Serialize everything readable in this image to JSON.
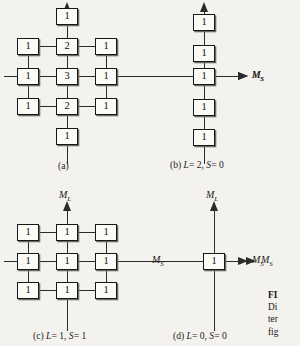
{
  "figure": {
    "panels": [
      {
        "id": "a",
        "caption": "(a)",
        "layout": "cross",
        "axis_labels": {
          "horizontal_right": "M",
          "horizontal_right_sub": "S"
        },
        "grid_values": [
          [
            "",
            "1",
            ""
          ],
          [
            "1",
            "2",
            "1"
          ],
          [
            "1",
            "3",
            "1"
          ],
          [
            "1",
            "2",
            "1"
          ],
          [
            "",
            "1",
            ""
          ]
        ]
      },
      {
        "id": "b",
        "caption": "(b) L = 2, S = 0",
        "caption_parts": {
          "tag": "(b)",
          "L_label": "L",
          "L_value": "= 2,",
          "S_label": "S",
          "S_value": "= 0"
        },
        "layout": "column",
        "axis_labels": {
          "horizontal_right": "M",
          "horizontal_right_sub": "S"
        },
        "grid_values": [
          [
            "1"
          ],
          [
            "1"
          ],
          [
            "1"
          ],
          [
            "1"
          ],
          [
            "1"
          ]
        ]
      },
      {
        "id": "c",
        "caption": "(c) L = 1, S = 1",
        "caption_parts": {
          "tag": "(c)",
          "L_label": "L",
          "L_value": "= 1,",
          "S_label": "S",
          "S_value": "= 1"
        },
        "layout": "grid3x3",
        "axis_labels": {
          "vertical_top": "M",
          "vertical_top_sub": "L",
          "horizontal_right": "M",
          "horizontal_right_sub": "S"
        },
        "grid_values": [
          [
            "1",
            "1",
            "1"
          ],
          [
            "1",
            "1",
            "1"
          ],
          [
            "1",
            "1",
            "1"
          ]
        ]
      },
      {
        "id": "d",
        "caption": "(d) L = 0, S = 0",
        "caption_parts": {
          "tag": "(d)",
          "L_label": "L",
          "L_value": "= 0,",
          "S_label": "S",
          "S_value": "= 0"
        },
        "layout": "single",
        "axis_labels": {
          "vertical_top": "M",
          "vertical_top_sub": "L",
          "horizontal_left": "M",
          "horizontal_left_sub": "S",
          "horizontal_right": "M",
          "horizontal_right_sub": "S"
        },
        "grid_values": [
          [
            "1"
          ]
        ]
      }
    ],
    "figure_caption_lines": [
      "FI",
      "Di",
      "ter",
      "fig"
    ]
  },
  "colors": {
    "page_background": "#f4f2ee",
    "ink": "#1b1b1b",
    "box_fill": "#fbfaf7",
    "box_border": "#171717",
    "box_shadow": "#6d6a66"
  }
}
